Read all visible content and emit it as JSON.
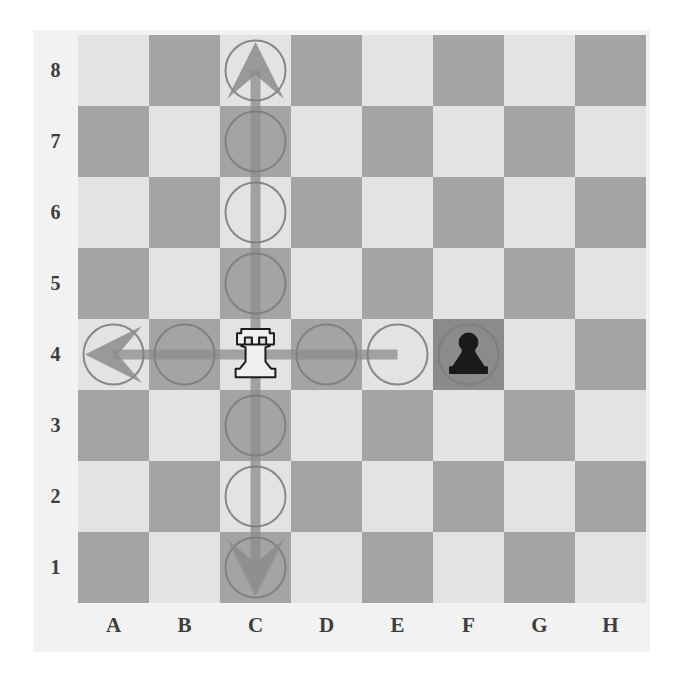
{
  "board": {
    "files": [
      "A",
      "B",
      "C",
      "D",
      "E",
      "F",
      "G",
      "H"
    ],
    "ranks": [
      "8",
      "7",
      "6",
      "5",
      "4",
      "3",
      "2",
      "1"
    ],
    "light_square_color": "#e3e3e3",
    "dark_square_color": "#a4a4a4",
    "highlight_square_color": "#8b8b8b",
    "label_color": "#3d3d3d",
    "background_color": "#f2f2f2",
    "square_size": 71,
    "orientation": "white-bottom"
  },
  "pieces": [
    {
      "id": "white-rook-c4",
      "type": "rook",
      "color": "white",
      "square": "C4",
      "file_index": 2,
      "rank_index": 4,
      "fill": "#f0f0f0",
      "stroke": "#1c1c1c"
    },
    {
      "id": "black-pawn-f4",
      "type": "pawn",
      "color": "black",
      "square": "F4",
      "file_index": 5,
      "rank_index": 4,
      "fill": "#1a1a1a",
      "stroke": "#1a1a1a"
    }
  ],
  "move_markers": [
    {
      "id": "marker-c8",
      "square": "C8",
      "file_index": 2,
      "rank_index": 0,
      "shape": "circle",
      "arrow": "up",
      "connector": "vertical-down"
    },
    {
      "id": "marker-c7",
      "square": "C7",
      "file_index": 2,
      "rank_index": 1,
      "shape": "circle",
      "arrow": "none",
      "connector": "vertical"
    },
    {
      "id": "marker-c6",
      "square": "C6",
      "file_index": 2,
      "rank_index": 2,
      "shape": "circle",
      "arrow": "none",
      "connector": "vertical"
    },
    {
      "id": "marker-c5",
      "square": "C5",
      "file_index": 2,
      "rank_index": 3,
      "shape": "circle",
      "arrow": "none",
      "connector": "vertical"
    },
    {
      "id": "marker-c3",
      "square": "C3",
      "file_index": 2,
      "rank_index": 5,
      "shape": "circle",
      "arrow": "none",
      "connector": "vertical"
    },
    {
      "id": "marker-c2",
      "square": "C2",
      "file_index": 2,
      "rank_index": 6,
      "shape": "circle",
      "arrow": "none",
      "connector": "vertical"
    },
    {
      "id": "marker-c1",
      "square": "C1",
      "file_index": 2,
      "rank_index": 7,
      "shape": "circle",
      "arrow": "down",
      "connector": "vertical-up"
    },
    {
      "id": "marker-a4",
      "square": "A4",
      "file_index": 0,
      "rank_index": 4,
      "shape": "circle",
      "arrow": "left",
      "connector": "horizontal-right"
    },
    {
      "id": "marker-b4",
      "square": "B4",
      "file_index": 1,
      "rank_index": 4,
      "shape": "circle",
      "arrow": "none",
      "connector": "horizontal"
    },
    {
      "id": "marker-d4",
      "square": "D4",
      "file_index": 3,
      "rank_index": 4,
      "shape": "circle",
      "arrow": "none",
      "connector": "horizontal"
    },
    {
      "id": "marker-e4",
      "square": "E4",
      "file_index": 4,
      "rank_index": 4,
      "shape": "circle",
      "arrow": "none",
      "connector": "horizontal-left"
    },
    {
      "id": "marker-f4",
      "square": "F4",
      "file_index": 5,
      "rank_index": 4,
      "shape": "circle",
      "arrow": "none",
      "connector": "none"
    }
  ],
  "marker_style": {
    "circle_stroke": "#7d7d7d",
    "circle_stroke_width": 2,
    "circle_radius": 30,
    "connector_color": "#8c8c8c",
    "connector_width": 10,
    "arrow_fill": "#8c8c8c"
  }
}
